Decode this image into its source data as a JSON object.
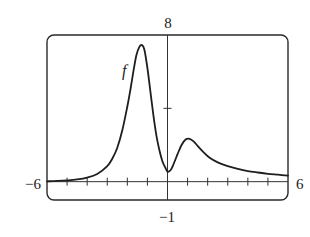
{
  "chart_data": {
    "type": "line",
    "title": "",
    "xlabel": "",
    "ylabel": "",
    "xlim": [
      -6,
      6
    ],
    "ylim": [
      -1,
      8
    ],
    "x_tick_step": 1,
    "y_tick_step": 4,
    "grid": false,
    "legend": null,
    "window_labels": {
      "xmin": "−6",
      "xmax": "6",
      "ymin": "−1",
      "ymax": "8"
    },
    "annotations": [
      {
        "text": "f",
        "x": -2.1,
        "y": 6.1
      }
    ],
    "series": [
      {
        "name": "f",
        "x": [
          -6,
          -5.5,
          -5,
          -4.5,
          -4,
          -3.5,
          -3,
          -2.75,
          -2.5,
          -2.25,
          -2,
          -1.85,
          -1.7,
          -1.55,
          -1.4,
          -1.27,
          -1.15,
          -1.0,
          -0.85,
          -0.7,
          -0.55,
          -0.4,
          -0.25,
          -0.1,
          0,
          0.15,
          0.3,
          0.5,
          0.7,
          0.9,
          1.1,
          1.3,
          1.5,
          1.8,
          2.1,
          2.5,
          3,
          3.5,
          4,
          4.5,
          5,
          5.5,
          6
        ],
        "y": [
          0.02,
          0.04,
          0.07,
          0.12,
          0.22,
          0.42,
          0.85,
          1.25,
          1.85,
          2.8,
          4.1,
          5.0,
          6.0,
          6.9,
          7.35,
          7.45,
          7.2,
          6.2,
          4.9,
          3.6,
          2.5,
          1.7,
          1.1,
          0.75,
          0.55,
          0.62,
          0.95,
          1.5,
          2.0,
          2.3,
          2.34,
          2.2,
          1.95,
          1.6,
          1.3,
          1.05,
          0.85,
          0.7,
          0.58,
          0.5,
          0.43,
          0.38,
          0.33
        ]
      }
    ]
  }
}
